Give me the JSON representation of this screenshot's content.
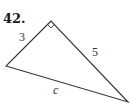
{
  "problem": {
    "number": "42."
  },
  "triangle": {
    "type": "right-triangle",
    "right_angle_at": "top vertex",
    "vertices": {
      "top": [
        51,
        21
      ],
      "left": [
        6,
        66
      ],
      "bottom_right": [
        128,
        102
      ]
    },
    "sides": {
      "left_leg": "3",
      "right_leg": "5",
      "hypotenuse": "c"
    },
    "colors": {
      "stroke": "#333333"
    }
  }
}
